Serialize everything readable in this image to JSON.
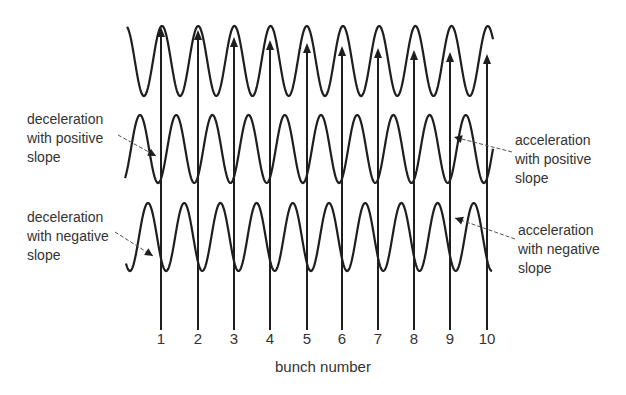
{
  "chart_data": {
    "type": "diagram",
    "title": "",
    "xlabel": "bunch number",
    "categories": [
      "1",
      "2",
      "3",
      "4",
      "5",
      "6",
      "7",
      "8",
      "9",
      "10"
    ],
    "bunch_x_px": [
      161,
      198,
      234,
      270,
      307,
      342,
      378,
      414,
      450,
      487
    ],
    "arrow_tip_y_px": [
      27,
      30,
      37,
      40,
      43,
      46,
      48,
      50,
      52,
      54
    ],
    "arrow_base_y_px": 330,
    "waves": [
      {
        "name": "top",
        "x_start": 127,
        "x_end": 493,
        "center_y": 61,
        "amplitude": 35,
        "period": 36.2,
        "peak_x": 162
      },
      {
        "name": "middle",
        "x_start": 125,
        "x_end": 493,
        "center_y": 149,
        "amplitude": 34,
        "period": 36.2,
        "peak_x": 140
      },
      {
        "name": "bottom",
        "x_start": 126,
        "x_end": 492,
        "center_y": 237,
        "amplitude": 34,
        "period": 36.2,
        "peak_x": 148
      }
    ],
    "annotations": [
      {
        "text": "deceleration\nwith positive\nslope",
        "side": "left",
        "target": [
          156,
          156
        ]
      },
      {
        "text": "deceleration\nwith negative\nslope",
        "side": "left",
        "target": [
          153,
          256
        ]
      },
      {
        "text": "acceleration\nwith positive\nslope",
        "side": "right",
        "target": [
          454,
          137
        ]
      },
      {
        "text": "acceleration\nwith negative\nslope",
        "side": "right",
        "target": [
          455,
          218
        ]
      }
    ]
  },
  "labels": {
    "decel_pos": "deceleration\nwith positive\nslope",
    "decel_neg": "deceleration\nwith negative\nslope",
    "accel_pos": "acceleration\nwith positive\nslope",
    "accel_neg": "acceleration\nwith negative\nslope",
    "xlabel": "bunch number"
  },
  "ticks": [
    "1",
    "2",
    "3",
    "4",
    "5",
    "6",
    "7",
    "8",
    "9",
    "10"
  ],
  "colors": {
    "ink": "#1e1e1e",
    "text": "#333333",
    "leader": "#555555"
  }
}
